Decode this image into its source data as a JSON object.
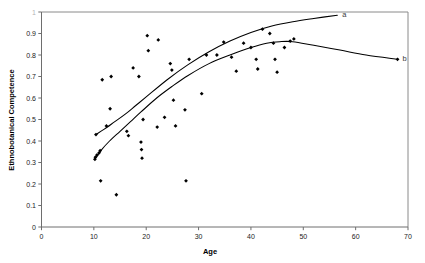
{
  "chart_data": {
    "type": "scatter",
    "title": "",
    "xlabel": "Age",
    "ylabel": "Ethnobotanical Competence",
    "xlim": [
      0,
      70
    ],
    "ylim": [
      0,
      1
    ],
    "grid": false,
    "legend_position": "inline-end-of-curve",
    "xticks": [
      0,
      10,
      20,
      30,
      40,
      50,
      60,
      70
    ],
    "xtick_labels": [
      "0",
      "10",
      "20",
      "30",
      "40",
      "50",
      "60",
      "70"
    ],
    "yticks": [
      0,
      0.1,
      0.2,
      0.3,
      0.4,
      0.5,
      0.6,
      0.7,
      0.8,
      0.9,
      1
    ],
    "ytick_labels": [
      "0",
      "0.1",
      "0.2",
      "0.3",
      "0.4",
      "0.5",
      "0.6",
      "0.7",
      "0.8",
      "0.9",
      "1"
    ],
    "points": [
      [
        10.2,
        0.315
      ],
      [
        10.3,
        0.325
      ],
      [
        10.4,
        0.43
      ],
      [
        10.6,
        0.335
      ],
      [
        11.0,
        0.345
      ],
      [
        11.2,
        0.355
      ],
      [
        11.3,
        0.215
      ],
      [
        11.6,
        0.685
      ],
      [
        12.4,
        0.47
      ],
      [
        13.1,
        0.55
      ],
      [
        13.3,
        0.7
      ],
      [
        14.3,
        0.15
      ],
      [
        16.3,
        0.445
      ],
      [
        16.6,
        0.425
      ],
      [
        17.5,
        0.74
      ],
      [
        18.6,
        0.7
      ],
      [
        19.0,
        0.395
      ],
      [
        19.1,
        0.36
      ],
      [
        19.2,
        0.32
      ],
      [
        19.4,
        0.5
      ],
      [
        20.2,
        0.89
      ],
      [
        20.4,
        0.82
      ],
      [
        22.1,
        0.465
      ],
      [
        22.3,
        0.87
      ],
      [
        23.5,
        0.51
      ],
      [
        24.6,
        0.76
      ],
      [
        24.9,
        0.73
      ],
      [
        25.2,
        0.59
      ],
      [
        25.6,
        0.47
      ],
      [
        27.4,
        0.545
      ],
      [
        27.6,
        0.215
      ],
      [
        28.2,
        0.78
      ],
      [
        30.6,
        0.62
      ],
      [
        31.5,
        0.8
      ],
      [
        33.5,
        0.8
      ],
      [
        34.8,
        0.86
      ],
      [
        36.3,
        0.79
      ],
      [
        37.2,
        0.725
      ],
      [
        38.6,
        0.855
      ],
      [
        40.0,
        0.835
      ],
      [
        41.0,
        0.78
      ],
      [
        41.3,
        0.735
      ],
      [
        42.2,
        0.92
      ],
      [
        43.6,
        0.9
      ],
      [
        44.3,
        0.855
      ],
      [
        44.6,
        0.78
      ],
      [
        45.0,
        0.72
      ],
      [
        46.4,
        0.835
      ],
      [
        47.5,
        0.865
      ],
      [
        48.2,
        0.875
      ],
      [
        68.0,
        0.78
      ]
    ],
    "series": [
      {
        "name": "a",
        "label": "a",
        "type": "line",
        "points": [
          [
            10.4,
            0.43
          ],
          [
            12.0,
            0.455
          ],
          [
            14.0,
            0.49
          ],
          [
            16.0,
            0.525
          ],
          [
            18.0,
            0.565
          ],
          [
            20.0,
            0.605
          ],
          [
            24.0,
            0.685
          ],
          [
            28.0,
            0.755
          ],
          [
            32.0,
            0.815
          ],
          [
            36.0,
            0.865
          ],
          [
            40.0,
            0.905
          ],
          [
            44.0,
            0.935
          ],
          [
            48.0,
            0.955
          ],
          [
            52.0,
            0.97
          ],
          [
            56.5,
            0.985
          ]
        ]
      },
      {
        "name": "b",
        "label": "b",
        "type": "line",
        "points": [
          [
            10.2,
            0.315
          ],
          [
            11.5,
            0.36
          ],
          [
            13.0,
            0.4
          ],
          [
            15.0,
            0.445
          ],
          [
            17.0,
            0.49
          ],
          [
            19.0,
            0.535
          ],
          [
            22.0,
            0.6
          ],
          [
            25.0,
            0.655
          ],
          [
            28.0,
            0.705
          ],
          [
            32.0,
            0.76
          ],
          [
            36.0,
            0.8
          ],
          [
            40.0,
            0.835
          ],
          [
            43.0,
            0.855
          ],
          [
            45.5,
            0.862
          ],
          [
            48.0,
            0.862
          ],
          [
            52.0,
            0.845
          ],
          [
            57.0,
            0.823
          ],
          [
            62.0,
            0.8
          ],
          [
            68.0,
            0.78
          ]
        ]
      }
    ]
  }
}
